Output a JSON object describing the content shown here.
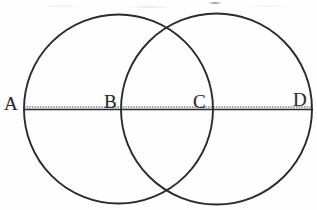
{
  "figure": {
    "background_color": "#fefefe",
    "stroke_color": "#2b2b30",
    "labels": [
      {
        "id": "A",
        "text": "A",
        "x": 4,
        "y": 94,
        "meaning": "left endpoint of left circle on the horizontal line"
      },
      {
        "id": "B",
        "text": "B",
        "x": 104,
        "y": 92,
        "meaning": "left endpoint of right circle on the horizontal line"
      },
      {
        "id": "C",
        "text": "C",
        "x": 193,
        "y": 92,
        "meaning": "right endpoint of left circle on the horizontal line"
      },
      {
        "id": "D",
        "text": "D",
        "x": 293,
        "y": 90,
        "meaning": "right endpoint of right circle on the horizontal line"
      }
    ],
    "circles": [
      {
        "id": "left-circle",
        "cx": 118.5,
        "cy": 109,
        "r": 94.5
      },
      {
        "id": "right-circle",
        "cx": 216.5,
        "cy": 109,
        "r": 95.5
      }
    ],
    "line": {
      "id": "horizontal-axis-line",
      "x1": 24,
      "y1": 109.5,
      "x2": 313,
      "y2": 109.5
    },
    "intersections": [
      {
        "id": "upper-intersection",
        "x": 168,
        "y": 25
      },
      {
        "id": "lower-intersection",
        "x": 168,
        "y": 194
      }
    ]
  }
}
